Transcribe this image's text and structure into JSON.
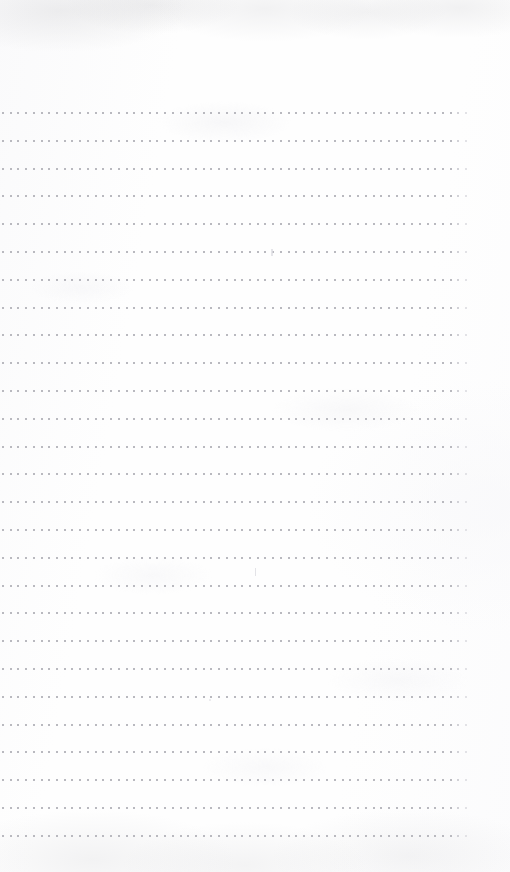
{
  "document": {
    "kind": "scanned-notebook-page",
    "description": "Blank dotted-grid notebook page scan",
    "page_width": 510,
    "page_height": 872,
    "content_text": "",
    "background_color": "#fefefe",
    "dot_color": "#b9b9bf",
    "texture_color": "#c8c8cb"
  },
  "grid": {
    "type": "dotted-ruled-lines",
    "line_count": 27,
    "first_line_y": 112,
    "line_spacing": 27.8,
    "dots_per_line": 61,
    "dot_start_x": 2,
    "dot_end_x": 466,
    "dot_pitch": 7.72,
    "dot_size": 2
  },
  "margins": {
    "top": 112,
    "bottom": 38,
    "left": 2,
    "right": 44
  },
  "artifacts": [
    {
      "name": "ink-speck-upper",
      "x": 271,
      "y": 249
    },
    {
      "name": "ink-speck-middle",
      "x": 255,
      "y": 568
    },
    {
      "name": "ink-speck-lower",
      "x": 209,
      "y": 699
    }
  ]
}
